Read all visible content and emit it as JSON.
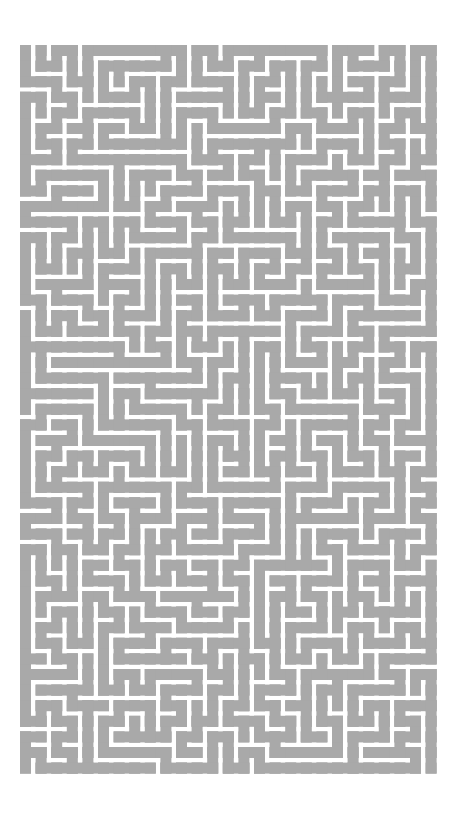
{
  "image": {
    "width": 466,
    "height": 817,
    "background": "#ffffff"
  },
  "maze": {
    "origin_x": 20,
    "origin_y": 45,
    "cols": 27,
    "rows": 47,
    "cell_pitch": 15.6,
    "passage_width": 11,
    "passage_color": "#a9a9a9",
    "wall_color": "#ffffff",
    "seed": 1337
  }
}
